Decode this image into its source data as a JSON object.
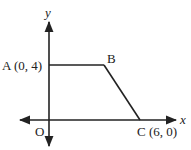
{
  "diagram": {
    "axis_labels": {
      "x": "x",
      "y": "y"
    },
    "origin_label": "O",
    "points": {
      "A": {
        "label": "A (0, 4)",
        "coords": [
          0,
          4
        ]
      },
      "B": {
        "label": "B"
      },
      "C": {
        "label": "C (6, 0)",
        "coords": [
          6,
          0
        ]
      }
    },
    "segments": [
      "AB",
      "BC"
    ],
    "stroke_color": "#222222"
  }
}
